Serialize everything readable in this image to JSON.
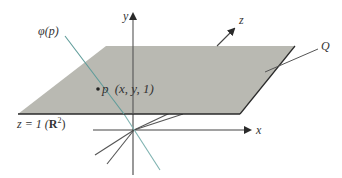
{
  "figure": {
    "labels": {
      "y_axis": "y",
      "z_axis": "z",
      "x_axis": "x",
      "phi": "φ(p)",
      "q_line": "Q",
      "point_p": "p",
      "point_coords": "(x, y, 1)",
      "plane_prefix": "z = 1 (",
      "plane_R": "R",
      "plane_exp": "2",
      "plane_suffix": ")"
    },
    "colors": {
      "plane_fill": "#b9b9b2",
      "plane_edge": "#2a2a2a",
      "axis": "#444444",
      "phi_line": "#5f9c9a",
      "lines": "#555555"
    }
  }
}
